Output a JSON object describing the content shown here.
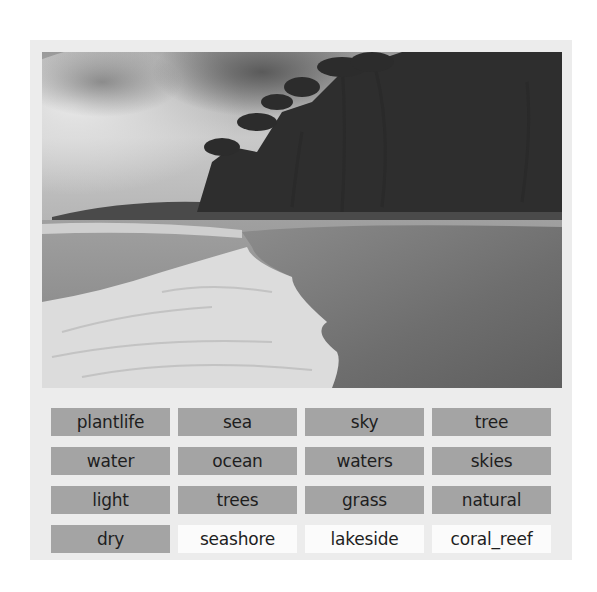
{
  "image": {
    "description": "grayscale tropical beach with palm trees, cloudy sky and breaking surf",
    "subject": "beach"
  },
  "tags": [
    {
      "label": "plantlife",
      "state": "highlighted"
    },
    {
      "label": "sea",
      "state": "highlighted"
    },
    {
      "label": "sky",
      "state": "highlighted"
    },
    {
      "label": "tree",
      "state": "highlighted"
    },
    {
      "label": "water",
      "state": "highlighted"
    },
    {
      "label": "ocean",
      "state": "highlighted"
    },
    {
      "label": "waters",
      "state": "highlighted"
    },
    {
      "label": "skies",
      "state": "highlighted"
    },
    {
      "label": "light",
      "state": "highlighted"
    },
    {
      "label": "trees",
      "state": "highlighted"
    },
    {
      "label": "grass",
      "state": "highlighted"
    },
    {
      "label": "natural",
      "state": "highlighted"
    },
    {
      "label": "dry",
      "state": "highlighted"
    },
    {
      "label": "seashore",
      "state": "plain"
    },
    {
      "label": "lakeside",
      "state": "plain"
    },
    {
      "label": "coral_reef",
      "state": "plain"
    }
  ],
  "colors": {
    "panel_bg": "#ececec",
    "tag_highlighted": "#a4a4a4",
    "tag_plain": "#fbfbfb",
    "text": "#1e1e1e"
  }
}
